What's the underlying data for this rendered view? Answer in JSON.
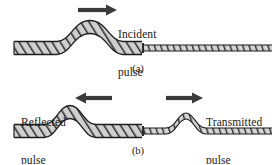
{
  "figure": {
    "background_color": "#ffffff",
    "ink_color": "#181818",
    "rope_fill_color": "#c9c9c9",
    "arrow_color": "#3a3a3a"
  },
  "panel_a": {
    "caption": "(a)",
    "arrow": {
      "name": "incident-arrow",
      "direction": "right",
      "x_start": 78,
      "x_end": 116,
      "y": 10
    },
    "label": "Incident\npulse",
    "label_line1": "Incident",
    "label_line2": "pulse",
    "thick_rope": {
      "x_start": 14,
      "x_end": 142,
      "baseline_y": 48,
      "pulse_peak_x": 90,
      "pulse_peak_y": 27,
      "style": "hatched-thick"
    },
    "thin_rope": {
      "x_start": 142,
      "x_end": 272,
      "baseline_y": 48,
      "style": "hatched-thin"
    },
    "junction_x": 142
  },
  "panel_b": {
    "caption": "(b)",
    "reflected": {
      "arrow": {
        "name": "reflected-arrow",
        "direction": "left",
        "x_start": 112,
        "x_end": 77,
        "y": 98
      },
      "label_line1": "Reflected",
      "label_line2": "pulse",
      "pulse_peak_x": 70,
      "pulse_peak_y": 112
    },
    "transmitted": {
      "arrow": {
        "name": "transmitted-arrow",
        "direction": "right",
        "x_start": 166,
        "x_end": 202,
        "y": 98
      },
      "label_line1": "Transmitted",
      "label_line2": "pulse",
      "pulse_peak_x": 186,
      "pulse_peak_y": 116
    },
    "thick_rope": {
      "x_start": 14,
      "x_end": 142,
      "baseline_y": 131,
      "style": "hatched-thick"
    },
    "thin_rope": {
      "x_start": 142,
      "x_end": 272,
      "baseline_y": 131,
      "style": "hatched-thin"
    },
    "junction_x": 142
  }
}
